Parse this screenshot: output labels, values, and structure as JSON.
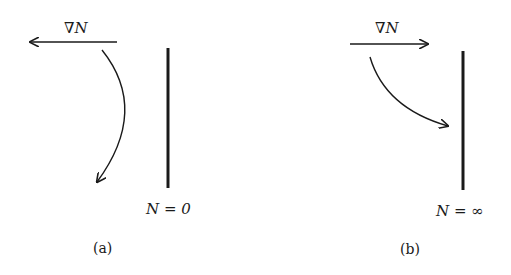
{
  "panels": [
    {
      "id": "a",
      "gradient_label": "∇N",
      "gradient_direction": "left",
      "boundary_label": "N = 0",
      "caption": "(a)",
      "ray_behavior": "curves away from boundary (downward-left)"
    },
    {
      "id": "b",
      "gradient_label": "∇N",
      "gradient_direction": "right",
      "boundary_label": "N = ∞",
      "caption": "(b)",
      "ray_behavior": "curves toward boundary"
    }
  ],
  "colors": {
    "ink": "#1a1a1a",
    "background": "#ffffff"
  }
}
